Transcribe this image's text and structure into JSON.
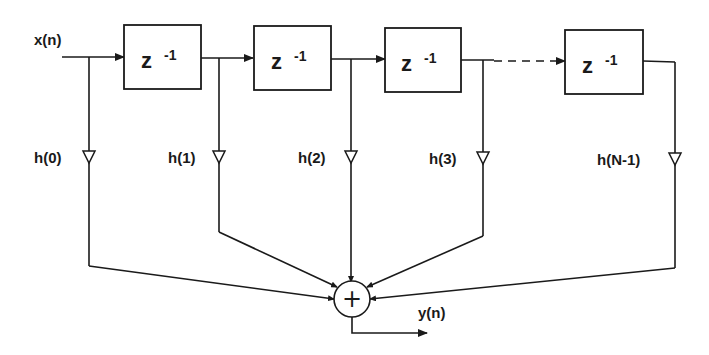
{
  "diagram": {
    "input_label": "x(n)",
    "output_label": "y(n)",
    "delay_blocks": [
      {
        "label": "z",
        "exponent": "-1"
      },
      {
        "label": "z",
        "exponent": "-1"
      },
      {
        "label": "z",
        "exponent": "-1"
      },
      {
        "label": "z",
        "exponent": "-1"
      }
    ],
    "taps": [
      {
        "label": "h(0)"
      },
      {
        "label": "h(1)"
      },
      {
        "label": "h(2)"
      },
      {
        "label": "h(3)"
      },
      {
        "label": "h(N-1)"
      }
    ],
    "adder_symbol": "+",
    "colors": {
      "line": "#1a1a1a",
      "background": "#ffffff"
    }
  }
}
